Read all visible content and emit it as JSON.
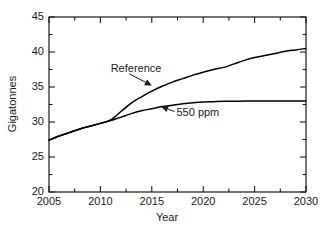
{
  "chart_data": {
    "type": "line",
    "title": "",
    "xlabel": "Year",
    "ylabel": "Gigatonnes",
    "xlim": [
      2005,
      2030
    ],
    "ylim": [
      20,
      45
    ],
    "xticks": [
      2005,
      2010,
      2015,
      2020,
      2025,
      2030
    ],
    "xtick_labels": [
      "2005",
      "2010",
      "2015",
      "2020",
      "2025",
      "2030"
    ],
    "xminor_step": 2.5,
    "yticks": [
      20,
      25,
      30,
      35,
      40,
      45
    ],
    "ytick_labels": [
      "20",
      "25",
      "30",
      "35",
      "40",
      "45"
    ],
    "yminor_step": 2.5,
    "grid": false,
    "legend_position": "inline-annotations",
    "series": [
      {
        "name": "Reference",
        "color": "#000000",
        "x": [
          2005,
          2006,
          2007,
          2008,
          2009,
          2010,
          2011,
          2012,
          2013,
          2014,
          2015,
          2016,
          2017,
          2018,
          2019,
          2020,
          2021,
          2022,
          2023,
          2024,
          2025,
          2026,
          2027,
          2028,
          2029,
          2030
        ],
        "values": [
          27.4,
          28.0,
          28.5,
          29.0,
          29.4,
          29.8,
          30.3,
          31.5,
          32.7,
          33.6,
          34.4,
          35.1,
          35.7,
          36.2,
          36.7,
          37.1,
          37.5,
          37.8,
          38.3,
          38.8,
          39.2,
          39.5,
          39.8,
          40.1,
          40.3,
          40.5
        ]
      },
      {
        "name": "550 ppm",
        "color": "#000000",
        "x": [
          2005,
          2006,
          2007,
          2008,
          2009,
          2010,
          2011,
          2012,
          2013,
          2014,
          2015,
          2016,
          2017,
          2018,
          2019,
          2020,
          2021,
          2022,
          2023,
          2024,
          2025,
          2026,
          2027,
          2028,
          2029,
          2030
        ],
        "values": [
          27.4,
          28.0,
          28.5,
          29.0,
          29.4,
          29.8,
          30.2,
          30.7,
          31.2,
          31.6,
          31.9,
          32.2,
          32.4,
          32.6,
          32.75,
          32.85,
          32.9,
          32.95,
          32.97,
          32.99,
          33.0,
          33.0,
          33.0,
          33.0,
          33.0,
          33.0
        ]
      }
    ],
    "annotations": [
      {
        "text": "Reference",
        "label_x": 2011.0,
        "label_y": 37.6,
        "arrow_from_x": 2012.8,
        "arrow_from_y": 36.9,
        "arrow_to_x": 2015.0,
        "arrow_to_y": 35.2
      },
      {
        "text": "550 ppm",
        "label_x": 2017.4,
        "label_y": 31.3,
        "arrow_from_x": 2017.2,
        "arrow_from_y": 31.5,
        "arrow_to_x": 2015.9,
        "arrow_to_y": 32.2
      }
    ]
  }
}
